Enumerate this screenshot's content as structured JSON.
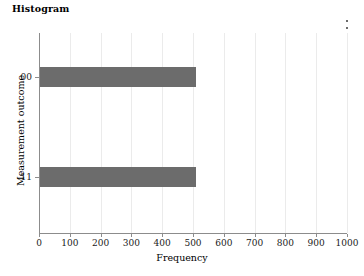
{
  "title": "Histogram",
  "menu": {
    "name": "more-options",
    "icon": "kebab-menu-icon",
    "dots": 3
  },
  "axes": {
    "x_title": "Frequency",
    "y_title": "Measurement outcome",
    "x_ticks": [
      "0",
      "100",
      "200",
      "300",
      "400",
      "500",
      "600",
      "700",
      "800",
      "900",
      "1000"
    ],
    "y_ticks": [
      "00",
      "11"
    ]
  },
  "colors": {
    "bar": "#6c6c6c",
    "grid": "#ebebeb",
    "axis": "#8c8c8c",
    "text": "#000000",
    "background": "#ffffff"
  },
  "chart_data": {
    "type": "bar",
    "orientation": "horizontal",
    "title": "Histogram",
    "xlabel": "Frequency",
    "ylabel": "Measurement outcome",
    "categories": [
      "00",
      "11"
    ],
    "values": [
      510,
      510
    ],
    "xlim": [
      0,
      1000
    ],
    "xticks": [
      0,
      100,
      200,
      300,
      400,
      500,
      600,
      700,
      800,
      900,
      1000
    ],
    "grid": "vertical-only",
    "legend": "none",
    "bar_color": "#6c6c6c"
  }
}
